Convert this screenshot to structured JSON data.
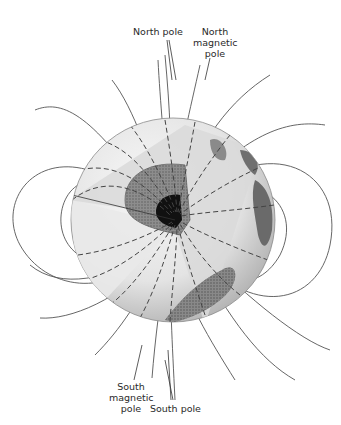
{
  "diagram": {
    "labels": {
      "north_pole": "North pole",
      "north_magnetic_pole": [
        "North",
        "magnetic",
        "pole"
      ],
      "south_magnetic_pole": [
        "South",
        "magnetic",
        "pole"
      ],
      "south_pole": "South pole"
    },
    "colors": {
      "background": "#ffffff",
      "field_line": "#555555",
      "globe_light": "#f2f2f2",
      "globe_shade": "#bdbdbd",
      "mantle_cut": "#d6d6d6",
      "outer_core": "#7a7a7a",
      "inner_core": "#111111",
      "land": "#6f6f6f",
      "label_text": "#2a2a2a"
    },
    "icons": {
      "globe": "earth-globe-icon",
      "core": "inner-core-icon"
    }
  }
}
